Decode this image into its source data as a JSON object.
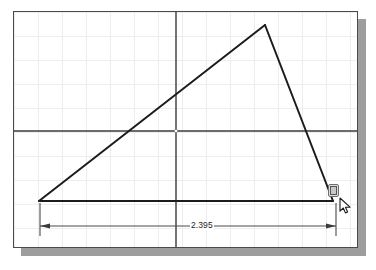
{
  "app": {
    "title": "CAD Sketch Editor",
    "view": "2D Sketch Drawing Area"
  },
  "sheet": {
    "background_color": "#ffffff",
    "border_color": "#4a4a4a",
    "shadow_color": "#9d9d9d",
    "grid_color": "#e9e9e9",
    "grid_spacing_px": 24
  },
  "axes": {
    "horizontal_label": "X axis",
    "vertical_label": "Y axis",
    "color": "#3a3a3a",
    "origin_marker": "origin-point"
  },
  "sketch": {
    "shape_name": "triangle",
    "line_color": "#1c1c1c",
    "vertices": [
      {
        "name": "left-vertex",
        "x": 39,
        "y": 201
      },
      {
        "name": "apex-vertex",
        "x": 265,
        "y": 25
      },
      {
        "name": "right-vertex",
        "x": 333,
        "y": 201
      }
    ]
  },
  "dimension": {
    "name": "horizontal-dimension",
    "value": "2.395",
    "color": "#3a3a3a",
    "arrow_left_x": 40,
    "arrow_right_x": 336,
    "line_y": 226
  },
  "cursor": {
    "name": "mouse-pointer",
    "x": 339,
    "y": 199
  },
  "snap": {
    "name": "endpoint-snap-marker",
    "icon": "snap-box-icon",
    "x": 328,
    "y": 184
  }
}
